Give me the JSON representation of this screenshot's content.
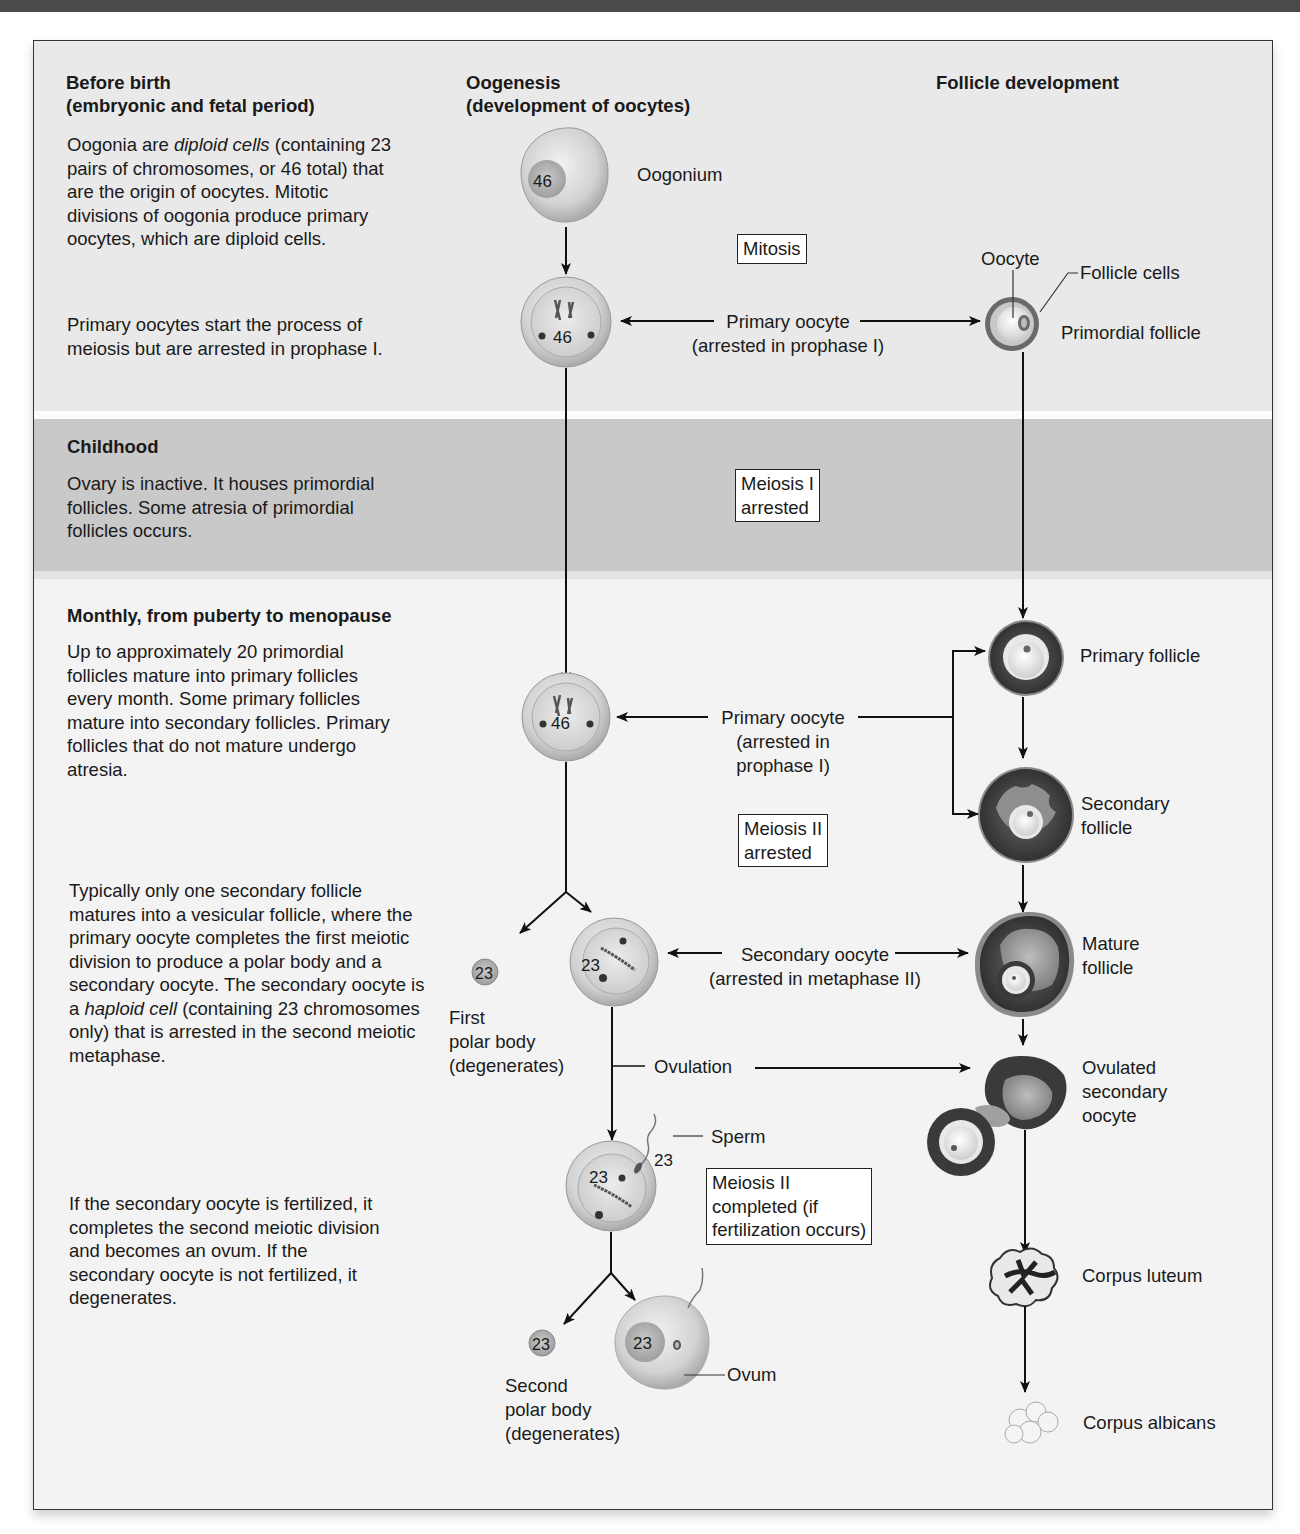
{
  "headers": {
    "stage_column": [
      "Before birth",
      "(embryonic and fetal period)"
    ],
    "oogenesis_column": [
      "Oogenesis",
      "(development of oocytes)"
    ],
    "follicle_column": "Follicle development"
  },
  "stages": {
    "before_birth": {
      "para1_a": "Oogonia are ",
      "para1_italic": "diploid cells",
      "para1_b": " (containing 23 pairs of chromosomes, or 46 total) that are the origin of oocytes. Mitotic divisions of oogonia produce primary oocytes, which are diploid cells.",
      "para2": "Primary oocytes start the process of meiosis but are arrested in prophase I."
    },
    "childhood": {
      "title": "Childhood",
      "text": "Ovary is inactive. It houses primordial follicles. Some atresia of primordial follicles occurs."
    },
    "monthly": {
      "title": "Monthly, from puberty to menopause",
      "text": "Up to approximately 20 primordial follicles mature into primary follicles every month. Some primary follicles mature into secondary follicles. Primary follicles that do not mature undergo atresia."
    },
    "vesicular": {
      "text_a": "Typically only one secondary follicle matures into a vesicular follicle, where the primary oocyte completes the first meiotic division to produce a polar body and a secondary oocyte. The secondary oocyte is a ",
      "text_italic": "haploid cell",
      "text_b": " (containing 23 chromosomes only) that is arrested in the second meiotic metaphase."
    },
    "fertilization": {
      "text": "If the secondary oocyte is fertilized, it completes the second meiotic division and becomes an ovum. If the secondary oocyte is not fertilized, it degenerates."
    }
  },
  "oogenesis": {
    "oogonium": {
      "label": "Oogonium",
      "chromosomes": "46"
    },
    "mitosis_box": "Mitosis",
    "primary_oocyte_1": {
      "line1": "Primary oocyte",
      "line2": "(arrested in prophase I)",
      "chromosomes": "46"
    },
    "meiosis1_box": [
      "Meiosis I",
      "arrested"
    ],
    "primary_oocyte_2": {
      "line1": "Primary oocyte",
      "line2": "(arrested in",
      "line3": "prophase I)",
      "chromosomes": "46"
    },
    "meiosis2_box": [
      "Meiosis II",
      "arrested"
    ],
    "first_polar_body": {
      "lines": [
        "First",
        "polar body",
        "(degenerates)"
      ],
      "chromosomes": "23"
    },
    "secondary_oocyte": {
      "line1": "Secondary oocyte",
      "line2": "(arrested in metaphase II)",
      "chromosomes": "23"
    },
    "ovulation": "Ovulation",
    "sperm": {
      "label": "Sperm",
      "chromosomes": "23"
    },
    "fertilized_oocyte_chromosomes": "23",
    "meiosis2_completed_box": [
      "Meiosis II",
      "completed (if",
      "fertilization occurs)"
    ],
    "second_polar_body": {
      "lines": [
        "Second",
        "polar body",
        "(degenerates)"
      ],
      "chromosomes": "23"
    },
    "ovum": {
      "label": "Ovum",
      "chromosomes": "23"
    }
  },
  "follicles": {
    "oocyte_label": "Oocyte",
    "follicle_cells_label": "Follicle cells",
    "primordial": "Primordial follicle",
    "primary": "Primary follicle",
    "secondary": [
      "Secondary",
      "follicle"
    ],
    "mature": [
      "Mature",
      "follicle"
    ],
    "ovulated": [
      "Ovulated",
      "secondary",
      "oocyte"
    ],
    "corpus_luteum": "Corpus luteum",
    "corpus_albicans": "Corpus albicans"
  },
  "colors": {
    "frame_bg": "#f4f4f4",
    "band_before": "#e9e9e9",
    "band_childhood": "#c9c9c9",
    "cell_fill": "#cfcfcf",
    "follicle_dark": "#3a3a3a",
    "arrow": "#111111"
  }
}
